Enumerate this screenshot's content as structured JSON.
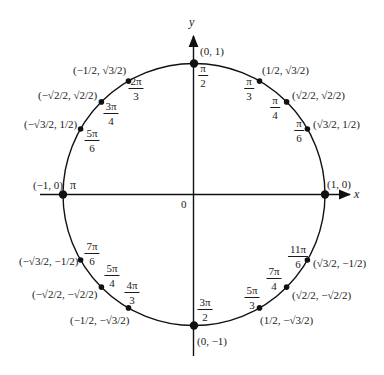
{
  "diagram": {
    "axes": {
      "x_label": "x",
      "y_label": "y",
      "origin_label": "0"
    },
    "center": {
      "cx": 194,
      "cy": 194.5,
      "r": 131
    },
    "points": [
      {
        "id": "0",
        "angle_deg": 0,
        "angle_label": "",
        "coord_label": "(1, 0)"
      },
      {
        "id": "pi6",
        "angle_deg": 30,
        "angle_label": {
          "num": "π",
          "den": "6"
        },
        "coord_label": "(√3/2, 1/2)"
      },
      {
        "id": "pi4",
        "angle_deg": 45,
        "angle_label": {
          "num": "π",
          "den": "4"
        },
        "coord_label": "(√2/2, √2/2)"
      },
      {
        "id": "pi3",
        "angle_deg": 60,
        "angle_label": {
          "num": "π",
          "den": "3"
        },
        "coord_label": "(1/2, √3/2)"
      },
      {
        "id": "pi2",
        "angle_deg": 90,
        "angle_label": {
          "num": "π",
          "den": "2"
        },
        "coord_label": "(0, 1)"
      },
      {
        "id": "2pi3",
        "angle_deg": 120,
        "angle_label": {
          "num": "2π",
          "den": "3"
        },
        "coord_label": "(−1/2, √3/2)"
      },
      {
        "id": "3pi4",
        "angle_deg": 135,
        "angle_label": {
          "num": "3π",
          "den": "4"
        },
        "coord_label": "(−√2/2, √2/2)"
      },
      {
        "id": "5pi6",
        "angle_deg": 150,
        "angle_label": {
          "num": "5π",
          "den": "6"
        },
        "coord_label": "(−√3/2, 1/2)"
      },
      {
        "id": "pi",
        "angle_deg": 180,
        "angle_label": "π",
        "coord_label": "(−1, 0)"
      },
      {
        "id": "7pi6",
        "angle_deg": 210,
        "angle_label": {
          "num": "7π",
          "den": "6"
        },
        "coord_label": "(−√3/2, −1/2)"
      },
      {
        "id": "5pi4",
        "angle_deg": 225,
        "angle_label": {
          "num": "5π",
          "den": "4"
        },
        "coord_label": "(−√2/2, −√2/2)"
      },
      {
        "id": "4pi3",
        "angle_deg": 240,
        "angle_label": {
          "num": "4π",
          "den": "3"
        },
        "coord_label": "(−1/2, −√3/2)"
      },
      {
        "id": "3pi2",
        "angle_deg": 270,
        "angle_label": {
          "num": "3π",
          "den": "2"
        },
        "coord_label": "(0, −1)"
      },
      {
        "id": "5pi3",
        "angle_deg": 300,
        "angle_label": {
          "num": "5π",
          "den": "3"
        },
        "coord_label": "(1/2, −√3/2)"
      },
      {
        "id": "7pi4",
        "angle_deg": 315,
        "angle_label": {
          "num": "7π",
          "den": "4"
        },
        "coord_label": "(√2/2, −√2/2)"
      },
      {
        "id": "11pi6",
        "angle_deg": 330,
        "angle_label": {
          "num": "11π",
          "den": "6"
        },
        "coord_label": "(√3/2, −1/2)"
      }
    ]
  }
}
